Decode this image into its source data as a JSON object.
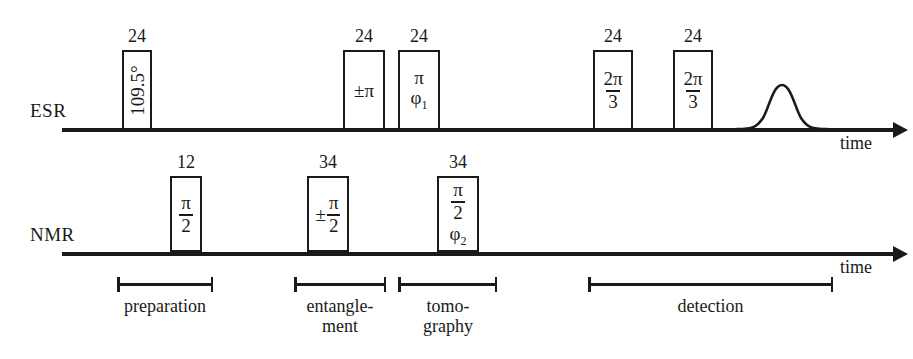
{
  "figure": {
    "type": "pulse-sequence-diagram",
    "channels": [
      {
        "name": "ESR",
        "label": "ESR",
        "time_axis_label": "time",
        "pulses": [
          {
            "duration": "24",
            "content": "109.5°",
            "style": "rotated"
          },
          {
            "duration": "24",
            "content": "±π",
            "style": "plain"
          },
          {
            "duration": "24",
            "numerator": "π",
            "phase": "φ",
            "phase_sub": "1",
            "style": "stacked-phase"
          },
          {
            "duration": "24",
            "numerator": "2π",
            "denominator": "3",
            "style": "fraction"
          },
          {
            "duration": "24",
            "numerator": "2π",
            "denominator": "3",
            "style": "fraction"
          }
        ],
        "echo": {
          "name": "gaussian-echo-signal"
        }
      },
      {
        "name": "NMR",
        "label": "NMR",
        "time_axis_label": "time",
        "pulses": [
          {
            "duration": "12",
            "numerator": "π",
            "denominator": "2",
            "style": "fraction"
          },
          {
            "duration": "34",
            "sign": "±",
            "numerator": "π",
            "denominator": "2",
            "style": "signed-fraction"
          },
          {
            "duration": "34",
            "numerator": "π",
            "denominator": "2",
            "phase": "φ",
            "phase_sub": "2",
            "style": "fraction-phase"
          }
        ]
      }
    ],
    "segments": [
      {
        "label_line1": "preparation",
        "label_line2": ""
      },
      {
        "label_line1": "entangle-",
        "label_line2": "ment"
      },
      {
        "label_line1": "tomo-",
        "label_line2": "graphy"
      },
      {
        "label_line1": "detection",
        "label_line2": ""
      }
    ],
    "colors": {
      "ink": "#1a1a1a",
      "background": "#ffffff"
    }
  }
}
